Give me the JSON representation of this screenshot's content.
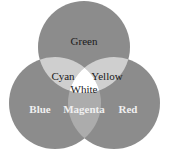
{
  "diagram": {
    "type": "venn",
    "title": "",
    "circles": [
      {
        "id": "green",
        "label": "Green",
        "cx": 84,
        "cy": 47,
        "r": 46,
        "fill": "#8c8c8c",
        "text_color": "#1a1a1a"
      },
      {
        "id": "blue",
        "label": "Blue",
        "cx": 55,
        "cy": 103,
        "r": 46,
        "fill": "#8c8c8c",
        "text_color": "#f0f0f0"
      },
      {
        "id": "red",
        "label": "Red",
        "cx": 114,
        "cy": 103,
        "r": 46,
        "fill": "#8c8c8c",
        "text_color": "#f0f0f0"
      }
    ],
    "overlaps": [
      {
        "sets": [
          "green",
          "blue"
        ],
        "label": "Cyan",
        "fill": "#cfcfcf",
        "text_color": "#1a1a1a"
      },
      {
        "sets": [
          "green",
          "red"
        ],
        "label": "Yellow",
        "fill": "#cfcfcf",
        "text_color": "#1a1a1a"
      },
      {
        "sets": [
          "blue",
          "red"
        ],
        "label": "Magenta",
        "fill": "#acacac",
        "text_color": "#f0f0f0"
      },
      {
        "sets": [
          "green",
          "blue",
          "red"
        ],
        "label": "White",
        "fill": "#ffffff",
        "text_color": "#1a1a1a"
      }
    ]
  }
}
